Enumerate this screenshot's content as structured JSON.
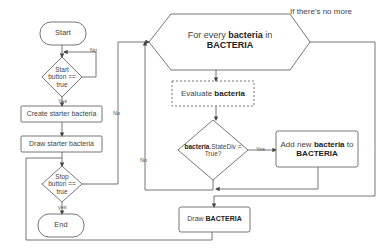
{
  "diagram": {
    "type": "flowchart",
    "nodes": {
      "start": {
        "label": "Start",
        "shape": "rounded-terminal"
      },
      "start_check": {
        "label": "Start button == true",
        "line1": "Start",
        "line2": "button ==",
        "line3": "true",
        "shape": "diamond"
      },
      "create": {
        "label": "Create starter bacteria",
        "shape": "rectangle"
      },
      "draw_starter": {
        "label": "Draw starter bacteria",
        "shape": "rectangle"
      },
      "stop_check": {
        "label": "Stop button == true",
        "line1": "Stop",
        "line2": "button ==",
        "line3": "true",
        "shape": "diamond"
      },
      "end": {
        "label": "End",
        "shape": "rounded-terminal"
      },
      "loop": {
        "pre": "For every ",
        "bold1": "bacteria",
        "mid": " in",
        "bold2": "BACTERIA",
        "shape": "hexagon"
      },
      "evaluate": {
        "pre": "Evaluate ",
        "bold": "bacteria",
        "shape": "dashed-rectangle"
      },
      "divide_check": {
        "bold": "bacteria",
        "post": ".StateDiv =",
        "line2": "True?",
        "shape": "diamond"
      },
      "add": {
        "pre": "Add new ",
        "bold1": "bacteria",
        "mid": " to",
        "bold2": "BACTERIA",
        "shape": "rectangle"
      },
      "draw": {
        "pre": "Draw ",
        "bold": "BACTERIA",
        "shape": "rectangle"
      }
    },
    "edge_labels": {
      "start_no": "No",
      "start_yes": "Yes",
      "stop_no": "No",
      "stop_yes": "yes",
      "divide_yes": "Yes",
      "divide_no": "No",
      "loop_exit": "If there's no more"
    },
    "colors": {
      "stroke": "#555555",
      "text": "#333333",
      "background": "#ffffff"
    }
  }
}
